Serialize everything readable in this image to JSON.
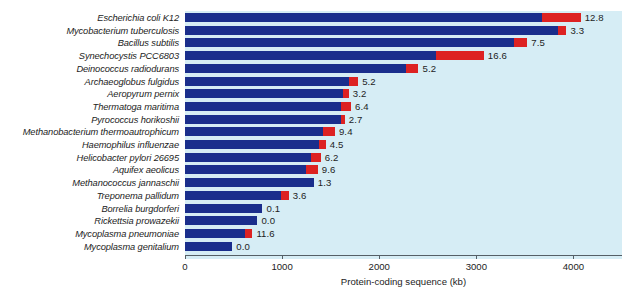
{
  "chart_data": {
    "type": "bar",
    "orientation": "horizontal",
    "stacked": true,
    "title": "",
    "xlabel": "Protein-coding sequence (kb)",
    "ylabel": "",
    "xlim": [
      0,
      4500
    ],
    "xticks": [
      0,
      1000,
      2000,
      3000,
      4000
    ],
    "xticklabels": [
      "0",
      "1000",
      "2000",
      "3000",
      "4000"
    ],
    "grid": false,
    "legend": "none",
    "colors": {
      "background": "#d6edf5",
      "page": "#ffffff",
      "series_blue": "#1a2e8c",
      "series_red": "#dd2222",
      "axis": "#555f66",
      "text": "#1d1d1d"
    },
    "categories": [
      "Escherichia coli K12",
      "Mycobacterium tuberculosis",
      "Bacillus subtilis",
      "Synechocystis PCC6803",
      "Deinococcus radiodurans",
      "Archaeoglobus fulgidus",
      "Aeropyrum pernix",
      "Thermatoga maritima",
      "Pyrococcus horikoshii",
      "Methanobacterium thermoautrophicum",
      "Haemophilus influenzae",
      "Helicobacter pylori 26695",
      "Aquifex aeolicus",
      "Methanococcus jannaschii",
      "Treponema pallidum",
      "Borrelia burgdorferi",
      "Rickettsia prowazekii",
      "Mycoplasma pneumoniae",
      "Mycoplasma genitalium"
    ],
    "series": [
      {
        "name": "blue-segment",
        "color": "#1a2e8c",
        "values": [
          3680,
          3845,
          3390,
          2580,
          2280,
          1690,
          1625,
          1605,
          1605,
          1420,
          1378,
          1295,
          1244,
          1326,
          985,
          798,
          746,
          622,
          487
        ]
      },
      {
        "name": "red-segment",
        "color": "#dd2222",
        "values": [
          394,
          83,
          135,
          497,
          124,
          93,
          62,
          104,
          41,
          124,
          72,
          104,
          124,
          0,
          83,
          0,
          0,
          72,
          0
        ]
      }
    ],
    "point_labels": [
      "12.8",
      "3.3",
      "7.5",
      "16.6",
      "5.2",
      "5.2",
      "3.2",
      "6.4",
      "2.7",
      "9.4",
      "4.5",
      "6.2",
      "9.6",
      "1.3",
      "3.6",
      "0.1",
      "0.0",
      "11.6",
      "0.0"
    ]
  }
}
